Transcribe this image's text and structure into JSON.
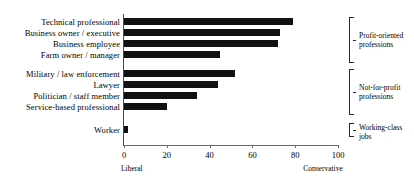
{
  "chart_data": {
    "type": "bar",
    "orientation": "horizontal",
    "title": "",
    "xlabel": "",
    "ylabel": "",
    "xlim": [
      0,
      100
    ],
    "grid": false,
    "legend": null,
    "categories": [
      "Technical professional",
      "Business owner / executive",
      "Business employee",
      "Farm owner / manager",
      "Military / law enforcement",
      "Lawyer",
      "Politician / staff member",
      "Service-based professional",
      "Worker"
    ],
    "values": [
      79,
      73,
      72,
      45,
      52,
      44,
      34,
      20,
      2
    ],
    "tick_values": [
      0,
      20,
      40,
      60,
      80,
      100
    ],
    "tick_labels": [
      "0",
      "20",
      "40",
      "60",
      "80",
      "100"
    ],
    "axis_endpoint_labels": {
      "left": "Liberal",
      "right": "Conservative"
    },
    "bar_color": "#111111",
    "groups": [
      {
        "label_line1": "Profit-oriented",
        "label_line2": "professions",
        "members": 4
      },
      {
        "label_line1": "Not-for-profit",
        "label_line2": "professions",
        "members": 4
      },
      {
        "label_line1": "Working-class",
        "label_line2": "jobs",
        "members": 1
      }
    ]
  },
  "layout": {
    "bar_rows": [
      {
        "top": 18,
        "value_index": 0
      },
      {
        "top": 29,
        "value_index": 1
      },
      {
        "top": 40,
        "value_index": 2
      },
      {
        "top": 51,
        "value_index": 3
      },
      {
        "top": 70,
        "value_index": 4
      },
      {
        "top": 81,
        "value_index": 5
      },
      {
        "top": 92,
        "value_index": 6
      },
      {
        "top": 103,
        "value_index": 7
      },
      {
        "top": 126,
        "value_index": 8
      }
    ],
    "group_boxes": [
      {
        "top": 17,
        "height": 46
      },
      {
        "top": 69,
        "height": 46
      },
      {
        "top": 123,
        "height": 14
      }
    ]
  }
}
